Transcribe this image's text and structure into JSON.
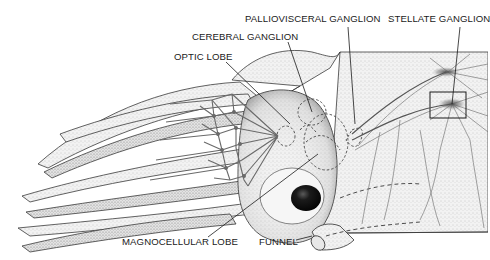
{
  "figure": {
    "labels": {
      "palliovisceral_ganglion": "PALLIOVISCERAL GANGLION",
      "stellate_ganglion": "STELLATE GANGLION",
      "cerebral_ganglion": "CEREBRAL GANGLION",
      "optic_lobe": "OPTIC LOBE",
      "magnocellular_lobe": "MAGNOCELLULAR LOBE",
      "funnel": "FUNNEL"
    },
    "colors": {
      "ink": "#1a1a1a",
      "stipple_light": "#d9d9d9",
      "stipple_mid": "#a8a8a8",
      "stipple_dark": "#555555",
      "nerve": "#6e6e6e",
      "eye": "#111111",
      "background": "#ffffff"
    }
  }
}
